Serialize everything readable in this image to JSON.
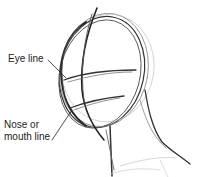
{
  "labels": {
    "eye_line": "Eye line",
    "nose_line_1": "Nose or",
    "nose_line_2": "mouth line"
  },
  "colors": {
    "stroke": "#2a2a2a",
    "light_stroke": "#9a9a9a",
    "background": "#ffffff"
  }
}
